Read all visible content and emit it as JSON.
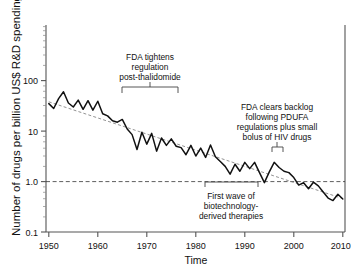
{
  "chart_data": {
    "type": "line",
    "title": "",
    "xlabel": "Time",
    "ylabel": "Number of drugs per billion US$ R&D spending",
    "xlim": [
      1950,
      2011
    ],
    "ylim": [
      0.1,
      300
    ],
    "yscale": "log",
    "grid": false,
    "legend": null,
    "xticks": [
      "1950",
      "1960",
      "1970",
      "1980",
      "1990",
      "2000",
      "2010"
    ],
    "xtick_values": [
      1950,
      1960,
      1970,
      1980,
      1990,
      2000,
      2010
    ],
    "yticks": [
      "100",
      "10",
      "1.0",
      "0.1"
    ],
    "ytick_values": [
      100,
      10,
      1.0,
      0.1
    ],
    "reference_line": {
      "label": "1.0",
      "value": 1.0,
      "style": "dashed"
    },
    "series": [
      {
        "name": "Number of drugs per billion US$ R&D spending",
        "style": "solid",
        "x": [
          1950,
          1951,
          1952,
          1953,
          1954,
          1955,
          1956,
          1957,
          1958,
          1959,
          1960,
          1961,
          1962,
          1963,
          1964,
          1965,
          1966,
          1967,
          1968,
          1969,
          1970,
          1971,
          1972,
          1973,
          1974,
          1975,
          1976,
          1977,
          1978,
          1979,
          1980,
          1981,
          1982,
          1983,
          1984,
          1985,
          1986,
          1987,
          1988,
          1989,
          1990,
          1991,
          1992,
          1993,
          1994,
          1995,
          1996,
          1997,
          1998,
          1999,
          2000,
          2001,
          2002,
          2003,
          2004,
          2005,
          2006,
          2007,
          2008,
          2009,
          2010
        ],
        "y": [
          35,
          28,
          44,
          60,
          36,
          30,
          41,
          27,
          40,
          26,
          39,
          22,
          20,
          16,
          15,
          17,
          11,
          8.5,
          4.3,
          9.5,
          5.5,
          9.0,
          4.0,
          7.3,
          5.2,
          7.0,
          5.0,
          4.7,
          3.4,
          5.2,
          3.2,
          4.6,
          3.0,
          5.3,
          3.1,
          2.5,
          2.0,
          1.4,
          2.2,
          1.6,
          2.4,
          1.8,
          2.4,
          1.5,
          0.95,
          1.55,
          2.4,
          1.9,
          1.6,
          1.5,
          1.2,
          0.85,
          0.95,
          0.72,
          0.97,
          0.82,
          0.62,
          0.47,
          0.42,
          0.56,
          0.45
        ]
      },
      {
        "name": "trend",
        "style": "dashed",
        "x": [
          1950,
          2010
        ],
        "y": [
          38,
          0.46
        ]
      }
    ],
    "annotations": [
      {
        "name": "fda-thalidomide",
        "lines": [
          "FDA tightens",
          "regulation",
          "post-thalidomide"
        ],
        "bracket_span": [
          1963,
          1971
        ],
        "bracket_direction": "down"
      },
      {
        "name": "fda-pdufa",
        "lines": [
          "FDA clears backlog",
          "following PDUFA",
          "regulations plus small",
          "bolus of HIV drugs"
        ],
        "bracket_span": [
          1996,
          1997
        ],
        "bracket_direction": "down"
      },
      {
        "name": "biotech-wave",
        "lines": [
          "First wave of",
          "biotechnology-",
          "derived therapies"
        ],
        "bracket_span": [
          1988,
          1998
        ],
        "bracket_direction": "down"
      }
    ]
  }
}
